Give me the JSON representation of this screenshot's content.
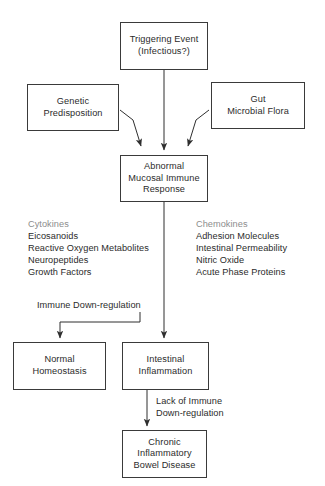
{
  "diagram": {
    "title_note": "",
    "nodes": {
      "trigger": {
        "line1": "Triggering Event",
        "line2": "(Infectious?)"
      },
      "genetic": {
        "line1": "Genetic",
        "line2": "Predisposition"
      },
      "gut": {
        "line1": "Gut",
        "line2": "Microbial Flora"
      },
      "abnormal": {
        "line1": "Abnormal",
        "line2": "Mucosal Immune",
        "line3": "Response"
      },
      "homeostasis": {
        "line1": "Normal",
        "line2": "Homeostasis"
      },
      "inflammation": {
        "line1": "Intestinal",
        "line2": "Inflammation"
      },
      "cibd": {
        "line1": "Chronic",
        "line2": "Inflammatory",
        "line3": "Bowel Disease"
      }
    },
    "mediator_list_left": {
      "item1": "Cytokines",
      "item2": "Eicosanoids",
      "item3": "Reactive Oxygen Metabolites",
      "item4": "Neuropeptides",
      "item5": "Growth Factors"
    },
    "mediator_list_right": {
      "item1": "Chemokines",
      "item2": "Adhesion Molecules",
      "item3": "Intestinal Permeability",
      "item4": "Nitric Oxide",
      "item5": "Acute Phase Proteins"
    },
    "edge_labels": {
      "down_regulation": "Immune Down-regulation",
      "lack_line1": "Lack of Immune",
      "lack_line2": "Down-regulation"
    },
    "colors": {
      "stroke": "#3a3a3a",
      "text": "#2b2b2b",
      "background": "#ffffff"
    }
  }
}
